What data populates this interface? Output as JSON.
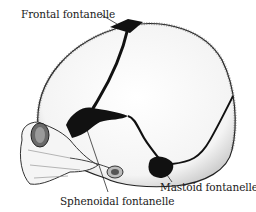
{
  "figure": {
    "labels": [
      {
        "id": "frontal",
        "text": "Frontal fontanelle"
      },
      {
        "id": "mastoid",
        "text": "Mastoid fontanelle"
      },
      {
        "id": "sphenoidal",
        "text": "Sphenoidal fontanelle"
      }
    ]
  },
  "colors": {
    "background": "#ffffff",
    "ink": "#111111",
    "bone_shade": "#e8e8e8"
  }
}
